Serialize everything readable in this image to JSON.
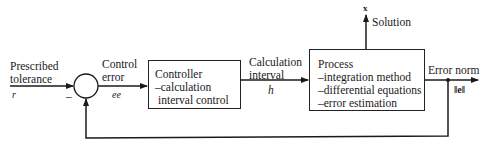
{
  "diagram": {
    "type": "feedback-control-block-diagram",
    "input": {
      "label_line1": "Prescribed",
      "label_line2": "tolerance",
      "symbol": "r"
    },
    "summing_junction": {
      "sign": "–"
    },
    "control_error": {
      "label_line1": "Control",
      "label_line2": "error",
      "symbol": "ee"
    },
    "controller": {
      "title": "Controller",
      "lines": [
        "–calculation",
        " interval control"
      ]
    },
    "calc_interval": {
      "label_line1": "Calculation",
      "label_line2": "interval",
      "symbol": "h"
    },
    "process": {
      "title": "Process",
      "lines": [
        "–integration method",
        "–differential equations",
        "–error estimation"
      ]
    },
    "solution": {
      "label": "Solution",
      "symbol": "x"
    },
    "output": {
      "label": "Error norm",
      "symbol": "‖e‖"
    },
    "feedback": "Error norm fed back to summing junction"
  }
}
